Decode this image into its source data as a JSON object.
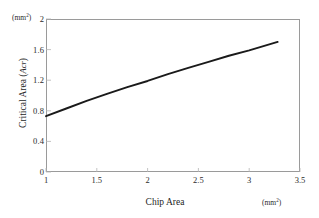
{
  "chart_data": {
    "type": "line",
    "title": "",
    "xlabel": "Chip Area",
    "ylabel": "Critical Area (Acr)",
    "x_unit": "(mm2)",
    "y_unit": "(mm2)",
    "xlim": [
      1,
      3.5
    ],
    "ylim": [
      0,
      2
    ],
    "grid": false,
    "legend": null,
    "x_ticks": [
      "1",
      "1.5",
      "2",
      "2.5",
      "3",
      "3.5"
    ],
    "x_tick_values": [
      1,
      1.5,
      2,
      2.5,
      3,
      3.5
    ],
    "y_ticks": [
      "0",
      "0.4",
      "0.8",
      "1.2",
      "1.6",
      "2"
    ],
    "y_tick_values": [
      0,
      0.4,
      0.8,
      1.2,
      1.6,
      2
    ],
    "series": [
      {
        "name": "Critical Area",
        "color": "#1a1a1a",
        "x": [
          1.0,
          1.2,
          1.4,
          1.6,
          1.8,
          2.0,
          2.2,
          2.4,
          2.6,
          2.8,
          3.0,
          3.28
        ],
        "values": [
          0.73,
          0.83,
          0.93,
          1.02,
          1.11,
          1.19,
          1.28,
          1.36,
          1.44,
          1.52,
          1.59,
          1.7
        ]
      }
    ]
  },
  "axes": {
    "y_unit_text": "(mm",
    "y_unit_sup": "2",
    "y_unit_close": ")",
    "x_unit_text": "(mm",
    "x_unit_sup": "2",
    "x_unit_close": ")",
    "y_title_main": "Critical Area (",
    "y_title_symbol": "Acr",
    "y_title_close": ")",
    "x_title": "Chip Area"
  },
  "y_tick_labels": [
    "2",
    "1.6",
    "1.2",
    "0.8",
    "0.4",
    "0"
  ],
  "x_tick_labels": [
    "1",
    "1.5",
    "2",
    "2.5",
    "3",
    "3.5"
  ]
}
